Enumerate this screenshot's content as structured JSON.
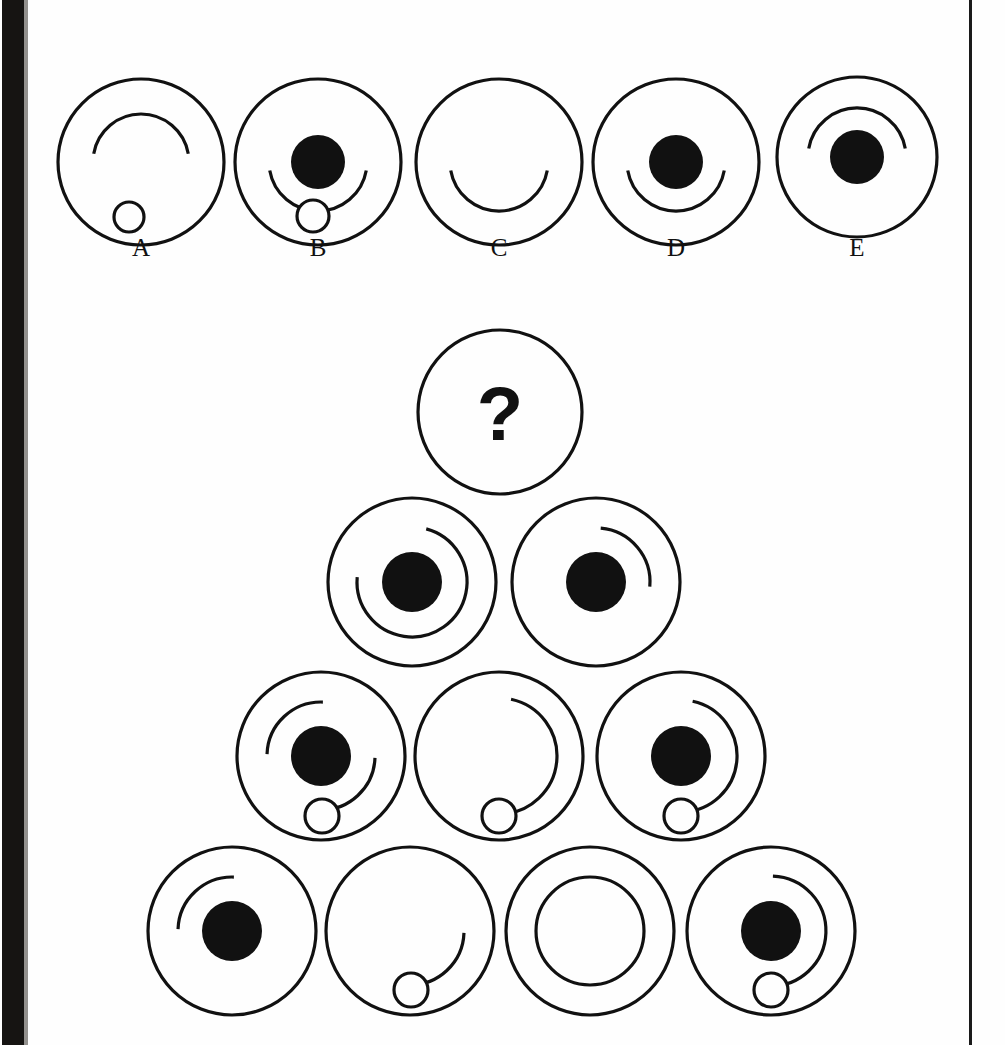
{
  "page": {
    "width": 1005,
    "height": 1045,
    "background": "#fefefe",
    "ink": "#111111",
    "gutter_color": "#161412",
    "stroke_width": 3.2,
    "type": "visual-analogy-puzzle"
  },
  "question": {
    "symbol": "?",
    "cx": 500,
    "cy": 412,
    "r": 82
  },
  "options_row": {
    "label_y": 256,
    "items": [
      {
        "id": "A",
        "label": "A",
        "cx": 141,
        "cy": 162,
        "r": 83,
        "has_filled_dot": false,
        "dot_r": 0,
        "arcs": [
          {
            "r": 48,
            "start": 190,
            "end": 350,
            "note": "cap-arc-opening-down"
          }
        ],
        "small_circle": {
          "cx": 129,
          "cy": 217,
          "r": 15
        }
      },
      {
        "id": "B",
        "label": "B",
        "cx": 318,
        "cy": 162,
        "r": 83,
        "has_filled_dot": true,
        "dot_r": 27,
        "arcs": [
          {
            "r": 49,
            "start": 10,
            "end": 170,
            "note": "cup-arc-opening-up"
          }
        ],
        "small_circle": {
          "cx": 313,
          "cy": 216,
          "r": 16
        }
      },
      {
        "id": "C",
        "label": "C",
        "cx": 499,
        "cy": 162,
        "r": 83,
        "has_filled_dot": false,
        "dot_r": 0,
        "arcs": [
          {
            "r": 49,
            "start": 10,
            "end": 170,
            "note": "cup-arc-opening-up"
          }
        ],
        "small_circle": null
      },
      {
        "id": "D",
        "label": "D",
        "cx": 676,
        "cy": 162,
        "r": 83,
        "has_filled_dot": true,
        "dot_r": 27,
        "arcs": [
          {
            "r": 49,
            "start": 10,
            "end": 170,
            "note": "cup-arc-opening-up"
          }
        ],
        "small_circle": null
      },
      {
        "id": "E",
        "label": "E",
        "cx": 857,
        "cy": 157,
        "r": 80,
        "has_filled_dot": true,
        "dot_r": 27,
        "arcs": [
          {
            "r": 49,
            "start": 190,
            "end": 350,
            "note": "cap-arc-opening-down"
          }
        ],
        "small_circle": null
      }
    ]
  },
  "pyramid_rows": [
    {
      "row": 2,
      "items": [
        {
          "id": "r2c1",
          "cx": 412,
          "cy": 582,
          "r": 84,
          "has_filled_dot": true,
          "dot_r": 30,
          "arcs": [
            {
              "r": 55,
              "start": 285,
              "end": 185,
              "note": "arc-270-gap-upper-left"
            }
          ],
          "small_circle": null
        },
        {
          "id": "r2c2",
          "cx": 596,
          "cy": 582,
          "r": 84,
          "has_filled_dot": true,
          "dot_r": 30,
          "arcs": [
            {
              "r": 54,
              "start": 275,
              "end": 5,
              "note": "arc-90-upper-right"
            }
          ],
          "small_circle": null
        }
      ]
    },
    {
      "row": 3,
      "items": [
        {
          "id": "r3c1",
          "cx": 321,
          "cy": 756,
          "r": 84,
          "has_filled_dot": true,
          "dot_r": 30,
          "arcs": [
            {
              "r": 54,
              "start": 182,
              "end": 272,
              "note": "arc-90-upper-left"
            },
            {
              "r": 54,
              "start": 2,
              "end": 92,
              "note": "arc-90-lower-right"
            }
          ],
          "small_circle": {
            "cx": 322,
            "cy": 816,
            "r": 17
          }
        },
        {
          "id": "r3c2",
          "cx": 499,
          "cy": 756,
          "r": 84,
          "has_filled_dot": false,
          "dot_r": 0,
          "arcs": [
            {
              "r": 58,
              "start": 282,
              "end": 88,
              "note": "arc-300-gap-right"
            }
          ],
          "small_circle": {
            "cx": 499,
            "cy": 816,
            "r": 17
          }
        },
        {
          "id": "r3c3",
          "cx": 681,
          "cy": 756,
          "r": 84,
          "has_filled_dot": true,
          "dot_r": 30,
          "arcs": [
            {
              "r": 56,
              "start": 282,
              "end": 88,
              "note": "arc-300-gap-right"
            }
          ],
          "small_circle": {
            "cx": 681,
            "cy": 816,
            "r": 17
          }
        }
      ]
    },
    {
      "row": 4,
      "items": [
        {
          "id": "r4c1",
          "cx": 232,
          "cy": 931,
          "r": 84,
          "has_filled_dot": true,
          "dot_r": 30,
          "arcs": [
            {
              "r": 54,
              "start": 182,
              "end": 272,
              "note": "arc-90-upper-left"
            }
          ],
          "small_circle": null
        },
        {
          "id": "r4c2",
          "cx": 410,
          "cy": 931,
          "r": 84,
          "has_filled_dot": false,
          "dot_r": 0,
          "arcs": [
            {
              "r": 54,
              "start": 2,
              "end": 92,
              "note": "arc-90-lower-right"
            }
          ],
          "small_circle": {
            "cx": 411,
            "cy": 990,
            "r": 17
          }
        },
        {
          "id": "r4c3",
          "cx": 590,
          "cy": 931,
          "r": 84,
          "has_filled_dot": false,
          "dot_r": 0,
          "arcs": [
            {
              "r": 54,
              "start": 0,
              "end": 360,
              "note": "full-inner-circle"
            }
          ],
          "small_circle": null
        },
        {
          "id": "r4c4",
          "cx": 771,
          "cy": 931,
          "r": 84,
          "has_filled_dot": true,
          "dot_r": 30,
          "arcs": [
            {
              "r": 55,
              "start": 272,
              "end": 92,
              "note": "arc-180-right-side"
            }
          ],
          "small_circle": {
            "cx": 771,
            "cy": 990,
            "r": 17
          }
        }
      ]
    }
  ]
}
